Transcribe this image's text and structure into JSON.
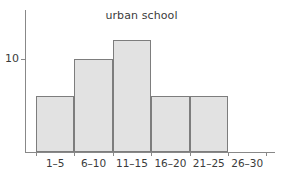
{
  "chart_data": {
    "type": "bar",
    "title": "urban school",
    "xlabel": "",
    "ylabel": "",
    "categories": [
      "1–5",
      "6–10",
      "11–15",
      "16–20",
      "21–25",
      "26–30"
    ],
    "values": [
      6,
      10,
      12,
      6,
      6,
      0
    ],
    "ylim": [
      0,
      15.5
    ],
    "ytick_values": [
      10
    ],
    "ytick_labels": [
      "10"
    ],
    "grid": false,
    "legend": null,
    "bar_fill_color": "#e2e2e2",
    "bar_border_color": "#7d7d7d",
    "axis_color": "#888888",
    "text_color": "#3b3b3b",
    "background_color": "#ffffff"
  }
}
